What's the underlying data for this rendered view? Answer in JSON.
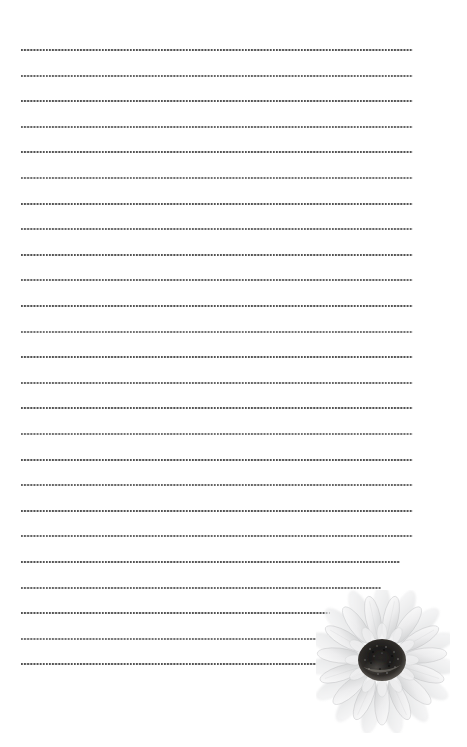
{
  "page": {
    "background_color": "#ffffff",
    "width": 467,
    "height": 747
  },
  "paper": {
    "line_style": "dotted",
    "line_color": "#4a4a4a",
    "line_count": 25,
    "first_line_y": 49,
    "line_spacing": 25.6,
    "left_margin": 21,
    "right_margin": 413,
    "lines": [
      {
        "index": 1,
        "y": 49,
        "x_start": 21,
        "x_end": 413,
        "tone": "tone-a"
      },
      {
        "index": 2,
        "y": 75,
        "x_start": 21,
        "x_end": 413,
        "tone": "tone-b"
      },
      {
        "index": 3,
        "y": 100,
        "x_start": 21,
        "x_end": 413,
        "tone": "tone-a"
      },
      {
        "index": 4,
        "y": 126,
        "x_start": 21,
        "x_end": 413,
        "tone": "tone-b"
      },
      {
        "index": 5,
        "y": 151,
        "x_start": 21,
        "x_end": 413,
        "tone": "tone-a"
      },
      {
        "index": 6,
        "y": 177,
        "x_start": 21,
        "x_end": 413,
        "tone": "tone-c"
      },
      {
        "index": 7,
        "y": 203,
        "x_start": 21,
        "x_end": 413,
        "tone": "tone-a"
      },
      {
        "index": 8,
        "y": 228,
        "x_start": 21,
        "x_end": 413,
        "tone": "tone-b"
      },
      {
        "index": 9,
        "y": 254,
        "x_start": 21,
        "x_end": 413,
        "tone": "tone-a"
      },
      {
        "index": 10,
        "y": 279,
        "x_start": 21,
        "x_end": 413,
        "tone": "tone-b"
      },
      {
        "index": 11,
        "y": 305,
        "x_start": 21,
        "x_end": 413,
        "tone": "tone-a"
      },
      {
        "index": 12,
        "y": 331,
        "x_start": 21,
        "x_end": 413,
        "tone": "tone-c"
      },
      {
        "index": 13,
        "y": 356,
        "x_start": 21,
        "x_end": 413,
        "tone": "tone-a"
      },
      {
        "index": 14,
        "y": 382,
        "x_start": 21,
        "x_end": 413,
        "tone": "tone-b"
      },
      {
        "index": 15,
        "y": 407,
        "x_start": 21,
        "x_end": 413,
        "tone": "tone-a"
      },
      {
        "index": 16,
        "y": 433,
        "x_start": 21,
        "x_end": 413,
        "tone": "tone-c"
      },
      {
        "index": 17,
        "y": 459,
        "x_start": 21,
        "x_end": 413,
        "tone": "tone-a"
      },
      {
        "index": 18,
        "y": 484,
        "x_start": 21,
        "x_end": 413,
        "tone": "tone-b"
      },
      {
        "index": 19,
        "y": 510,
        "x_start": 21,
        "x_end": 413,
        "tone": "tone-a"
      },
      {
        "index": 20,
        "y": 535,
        "x_start": 21,
        "x_end": 413,
        "tone": "tone-b"
      },
      {
        "index": 21,
        "y": 561,
        "x_start": 21,
        "x_end": 400,
        "tone": "tone-a"
      },
      {
        "index": 22,
        "y": 587,
        "x_start": 21,
        "x_end": 381,
        "tone": "tone-b"
      },
      {
        "index": 23,
        "y": 612,
        "x_start": 21,
        "x_end": 330,
        "tone": "tone-a"
      },
      {
        "index": 24,
        "y": 638,
        "x_start": 21,
        "x_end": 316,
        "tone": "tone-c"
      },
      {
        "index": 25,
        "y": 663,
        "x_start": 21,
        "x_end": 316,
        "tone": "tone-a"
      }
    ]
  },
  "decoration": {
    "illustration_name": "sunflower",
    "style": "faded grayscale watercolor",
    "position": "bottom-right",
    "x": 316,
    "y": 590,
    "width": 134,
    "height": 143,
    "petal_color": "#e9e9ea",
    "petal_shade_color": "#c9cacb",
    "center_color": "#1d1c1b",
    "center_highlight_color": "#585552"
  }
}
